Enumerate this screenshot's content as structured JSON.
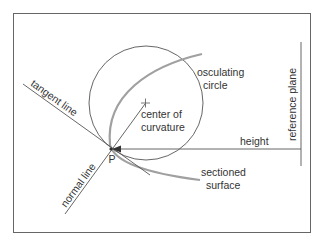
{
  "diagram": {
    "labels": {
      "tangent_line": "tangent line",
      "normal_line": "normal line",
      "osculating_1": "osculating",
      "osculating_2": "circle",
      "center_1": "center of",
      "center_2": "curvature",
      "height": "height",
      "sectioned_1": "sectioned",
      "sectioned_2": "surface",
      "reference_plane": "reference plane",
      "point": "P"
    },
    "colors": {
      "line": "#555555",
      "surface": "#a0a0a0",
      "frame": "#666666",
      "text": "#333333"
    }
  }
}
